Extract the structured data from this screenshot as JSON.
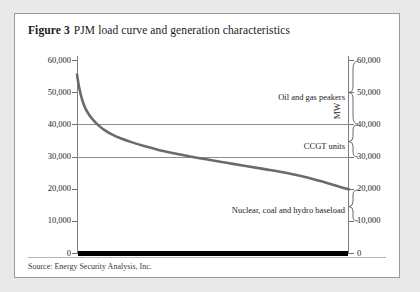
{
  "figure": {
    "number_label": "Figure 3",
    "title": "PJM load curve and generation characteristics",
    "source": "Source: Energy Security Analysis, Inc."
  },
  "axes": {
    "left_title": "MW",
    "right_title": "MW",
    "tick_labels": [
      "60,000",
      "50,000",
      "40,000",
      "30,000",
      "20,000",
      "10,000",
      "0"
    ],
    "tick_values": [
      60000,
      50000,
      40000,
      30000,
      20000,
      10000,
      0
    ]
  },
  "annotations": {
    "peakers": "Oil and gas peakers",
    "ccgt": "CCGT units",
    "baseload": "Nuclear, coal and hydro baseload"
  },
  "colors": {
    "curve": "#6b6b6b",
    "gridline": "#8d8d8d",
    "axis": "#7d7d7d",
    "baseload_bar": "#000000",
    "frame": "#9a9a9a",
    "page_background": "#e9e9e9",
    "panel_background": "#ffffff"
  },
  "chart_data": {
    "type": "line",
    "title": "PJM load curve and generation characteristics",
    "xlabel": "",
    "ylabel": "MW",
    "ylim": [
      0,
      60000
    ],
    "xlim": [
      0,
      100
    ],
    "grid": "horizontal gridlines at 30,000 and 40,000 MW",
    "legend": "none",
    "y_tick_labels": [
      "0",
      "10,000",
      "20,000",
      "30,000",
      "40,000",
      "50,000",
      "60,000"
    ],
    "y_tick_values": [
      0,
      10000,
      20000,
      30000,
      40000,
      50000,
      60000
    ],
    "x_axis_visible_ticks": false,
    "series": [
      {
        "name": "PJM load duration curve",
        "color": "#6b6b6b",
        "x": [
          0,
          0.8,
          1.8,
          3,
          4.5,
          6,
          8,
          10,
          13,
          16,
          20,
          25,
          30,
          36,
          42,
          48,
          55,
          62,
          70,
          78,
          85,
          91,
          95,
          98,
          100
        ],
        "values": [
          55500,
          51500,
          48000,
          45200,
          43000,
          41400,
          39700,
          38400,
          36900,
          35800,
          34600,
          33300,
          32200,
          31100,
          30100,
          29200,
          28200,
          27200,
          26100,
          24900,
          23600,
          22200,
          21200,
          20400,
          20000
        ]
      },
      {
        "name": "Nuclear, coal and hydro baseload bar",
        "color": "#000000",
        "type": "baseline-bar",
        "y": 0
      }
    ],
    "annotations": [
      {
        "text": "Oil and gas peakers",
        "bracket_range": [
          40000,
          60000
        ],
        "side": "right"
      },
      {
        "text": "CCGT units",
        "bracket_range": [
          30000,
          40000
        ],
        "side": "right"
      },
      {
        "text": "Nuclear, coal and hydro baseload",
        "bracket_range": [
          10000,
          20000
        ],
        "side": "right"
      }
    ]
  }
}
